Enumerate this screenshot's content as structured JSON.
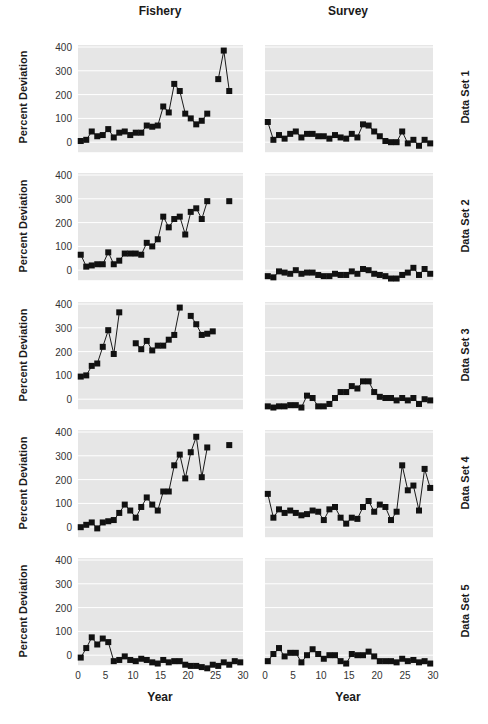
{
  "chart_data": {
    "type": "line",
    "title": "",
    "columns": [
      "Fishery",
      "Survey"
    ],
    "rows": [
      "Data Set 1",
      "Data Set 2",
      "Data Set 3",
      "Data Set 4",
      "Data Set 5"
    ],
    "xlabel": "Year",
    "ylabel": "Percent Deviation",
    "xlim": [
      0,
      30
    ],
    "ylim": [
      -40,
      400
    ],
    "xticks": [
      0,
      5,
      10,
      15,
      20,
      25,
      30
    ],
    "yticks": [
      0,
      100,
      200,
      300,
      400
    ],
    "grid": true,
    "marker": "square",
    "panels": [
      {
        "row": "Data Set 1",
        "column": "Fishery",
        "x": [
          0.5,
          1.5,
          2.5,
          3.5,
          4.5,
          5.5,
          6.5,
          7.5,
          8.5,
          9.5,
          10.5,
          11.5,
          12.5,
          13.5,
          14.5,
          15.5,
          16.5,
          17.5,
          18.5,
          19.5,
          20.5,
          21.5,
          22.5,
          23.5,
          null,
          25.5,
          26.5,
          27.5
        ],
        "values": [
          5,
          10,
          45,
          25,
          30,
          55,
          20,
          40,
          45,
          30,
          40,
          40,
          70,
          65,
          70,
          150,
          125,
          245,
          215,
          120,
          100,
          75,
          90,
          120,
          null,
          265,
          385,
          215
        ]
      },
      {
        "row": "Data Set 1",
        "column": "Survey",
        "x": [
          0.5,
          1.5,
          2.5,
          3.5,
          4.5,
          5.5,
          6.5,
          7.5,
          8.5,
          9.5,
          10.5,
          11.5,
          12.5,
          13.5,
          14.5,
          15.5,
          16.5,
          17.5,
          18.5,
          19.5,
          20.5,
          21.5,
          22.5,
          23.5,
          24.5,
          25.5,
          26.5,
          27.5,
          28.5,
          29.5
        ],
        "values": [
          85,
          10,
          30,
          15,
          35,
          45,
          20,
          35,
          35,
          25,
          25,
          15,
          30,
          20,
          15,
          35,
          20,
          75,
          70,
          45,
          25,
          5,
          0,
          0,
          45,
          -5,
          10,
          -15,
          10,
          -5
        ]
      },
      {
        "row": "Data Set 2",
        "column": "Fishery",
        "x": [
          0.5,
          1.5,
          2.5,
          3.5,
          4.5,
          5.5,
          6.5,
          7.5,
          8.5,
          9.5,
          10.5,
          11.5,
          12.5,
          13.5,
          14.5,
          15.5,
          16.5,
          17.5,
          18.5,
          19.5,
          20.5,
          21.5,
          22.5,
          23.5,
          null,
          27.5
        ],
        "values": [
          65,
          15,
          20,
          25,
          25,
          75,
          25,
          40,
          70,
          70,
          70,
          65,
          115,
          100,
          130,
          225,
          180,
          215,
          225,
          150,
          245,
          260,
          215,
          290,
          null,
          290
        ]
      },
      {
        "row": "Data Set 2",
        "column": "Survey",
        "x": [
          0.5,
          1.5,
          2.5,
          3.5,
          4.5,
          5.5,
          6.5,
          7.5,
          8.5,
          9.5,
          10.5,
          11.5,
          12.5,
          13.5,
          14.5,
          15.5,
          16.5,
          17.5,
          18.5,
          19.5,
          20.5,
          21.5,
          22.5,
          23.5,
          24.5,
          25.5,
          26.5,
          27.5,
          28.5,
          29.5
        ],
        "values": [
          -25,
          -30,
          -5,
          -10,
          -15,
          0,
          -15,
          -10,
          -10,
          -20,
          -25,
          -25,
          -15,
          -20,
          -20,
          -5,
          -15,
          5,
          0,
          -15,
          -20,
          -25,
          -35,
          -35,
          -20,
          -10,
          10,
          -20,
          5,
          -15
        ]
      },
      {
        "row": "Data Set 3",
        "column": "Fishery",
        "x": [
          0.5,
          1.5,
          2.5,
          3.5,
          4.5,
          5.5,
          6.5,
          7.5,
          null,
          10.5,
          11.5,
          12.5,
          13.5,
          14.5,
          15.5,
          16.5,
          17.5,
          18.5,
          null,
          20.5,
          21.5,
          22.5,
          23.5,
          24.5
        ],
        "values": [
          95,
          100,
          140,
          150,
          220,
          290,
          190,
          365,
          null,
          235,
          210,
          245,
          205,
          225,
          225,
          250,
          270,
          385,
          null,
          350,
          315,
          270,
          275,
          285
        ]
      },
      {
        "row": "Data Set 3",
        "column": "Survey",
        "x": [
          0.5,
          1.5,
          2.5,
          3.5,
          4.5,
          5.5,
          6.5,
          7.5,
          8.5,
          9.5,
          10.5,
          11.5,
          12.5,
          13.5,
          14.5,
          15.5,
          16.5,
          17.5,
          18.5,
          19.5,
          20.5,
          21.5,
          22.5,
          23.5,
          24.5,
          25.5,
          26.5,
          27.5,
          28.5,
          29.5
        ],
        "values": [
          -30,
          -35,
          -30,
          -30,
          -25,
          -25,
          -35,
          15,
          5,
          -30,
          -30,
          -20,
          5,
          30,
          30,
          55,
          45,
          75,
          75,
          30,
          10,
          5,
          5,
          -5,
          5,
          -5,
          5,
          -20,
          0,
          -5
        ]
      },
      {
        "row": "Data Set 4",
        "column": "Fishery",
        "x": [
          0.5,
          1.5,
          2.5,
          3.5,
          4.5,
          5.5,
          6.5,
          7.5,
          8.5,
          9.5,
          10.5,
          11.5,
          12.5,
          13.5,
          14.5,
          15.5,
          16.5,
          17.5,
          18.5,
          19.5,
          20.5,
          21.5,
          22.5,
          23.5,
          null,
          27.5
        ],
        "values": [
          0,
          10,
          20,
          -5,
          20,
          25,
          30,
          60,
          95,
          70,
          40,
          85,
          125,
          95,
          70,
          150,
          150,
          260,
          305,
          205,
          315,
          380,
          210,
          335,
          null,
          345
        ]
      },
      {
        "row": "Data Set 4",
        "column": "Survey",
        "x": [
          0.5,
          1.5,
          2.5,
          3.5,
          4.5,
          5.5,
          6.5,
          7.5,
          8.5,
          9.5,
          10.5,
          11.5,
          12.5,
          13.5,
          14.5,
          15.5,
          16.5,
          17.5,
          18.5,
          19.5,
          20.5,
          21.5,
          22.5,
          23.5,
          24.5,
          25.5,
          26.5,
          27.5,
          28.5,
          29.5
        ],
        "values": [
          140,
          40,
          75,
          60,
          70,
          60,
          50,
          55,
          70,
          65,
          30,
          75,
          85,
          40,
          15,
          40,
          35,
          85,
          110,
          65,
          95,
          85,
          30,
          65,
          260,
          155,
          175,
          70,
          245,
          165
        ]
      },
      {
        "row": "Data Set 5",
        "column": "Fishery",
        "x": [
          0.5,
          1.5,
          2.5,
          3.5,
          4.5,
          5.5,
          6.5,
          7.5,
          8.5,
          9.5,
          10.5,
          11.5,
          12.5,
          13.5,
          14.5,
          15.5,
          16.5,
          17.5,
          18.5,
          19.5,
          20.5,
          21.5,
          22.5,
          23.5,
          24.5,
          25.5,
          26.5,
          27.5,
          28.5,
          29.5
        ],
        "values": [
          -10,
          30,
          75,
          45,
          70,
          55,
          -25,
          -20,
          -5,
          -20,
          -25,
          -15,
          -20,
          -30,
          -35,
          -20,
          -30,
          -25,
          -25,
          -40,
          -45,
          -45,
          -50,
          -55,
          -40,
          -45,
          -30,
          -40,
          -25,
          -30
        ]
      },
      {
        "row": "Data Set 5",
        "column": "Survey",
        "x": [
          0.5,
          1.5,
          2.5,
          3.5,
          4.5,
          5.5,
          6.5,
          7.5,
          8.5,
          9.5,
          10.5,
          11.5,
          12.5,
          13.5,
          14.5,
          15.5,
          16.5,
          17.5,
          18.5,
          19.5,
          20.5,
          21.5,
          22.5,
          23.5,
          24.5,
          25.5,
          26.5,
          27.5,
          28.5,
          29.5
        ],
        "values": [
          -25,
          5,
          30,
          -5,
          10,
          10,
          -30,
          0,
          25,
          5,
          -15,
          0,
          0,
          -25,
          -35,
          5,
          0,
          0,
          15,
          -5,
          -25,
          -25,
          -25,
          -30,
          -15,
          -25,
          -20,
          -30,
          -25,
          -35
        ]
      }
    ]
  },
  "labels": {
    "col_fishery": "Fishery",
    "col_survey": "Survey",
    "ylabel": "Percent Deviation",
    "xlabel": "Year",
    "rows": [
      "Data Set 1",
      "Data Set 2",
      "Data Set 3",
      "Data Set 4",
      "Data Set 5"
    ]
  },
  "style": {
    "panel_bg": "#e6e6e6",
    "grid_color": "#ffffff",
    "line_color": "#1a1a1a",
    "marker_color": "#111111"
  }
}
